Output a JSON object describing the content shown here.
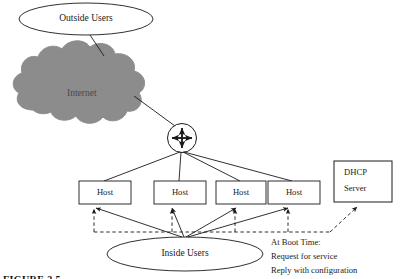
{
  "figure": {
    "caption": "FIGURE 2.5",
    "background_color": "#ffffff",
    "line_color": "#1a1a1a",
    "cloud_fill_color": "#8c8c8c"
  },
  "nodes": {
    "outside_users": {
      "label": "Outside Users",
      "shape": "ellipse"
    },
    "internet": {
      "label": "Internet",
      "shape": "cloud",
      "fill": "#8c8c8c"
    },
    "router": {
      "label": "",
      "shape": "circle-with-four-way-arrow",
      "icon": "four-direction-arrow-icon"
    },
    "inside_users": {
      "label": "Inside Users",
      "shape": "ellipse"
    },
    "dhcp_server": {
      "label_line1": "DHCP",
      "label_line2": "Server",
      "shape": "rectangle"
    }
  },
  "hosts": [
    {
      "label": "Host"
    },
    {
      "label": "Host"
    },
    {
      "label": "Host"
    },
    {
      "label": "Host"
    }
  ],
  "annotation": {
    "lines": [
      "At Boot Time:",
      "Request for service",
      "Reply with configuration"
    ]
  }
}
